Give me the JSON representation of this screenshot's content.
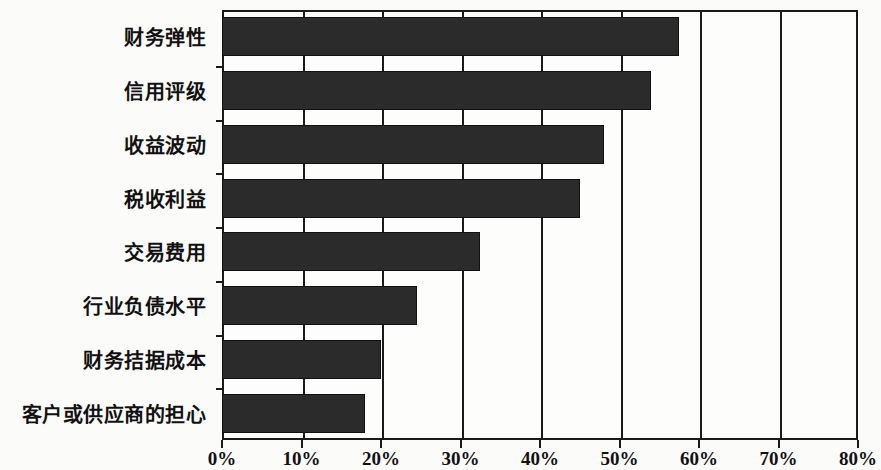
{
  "chart_data": {
    "type": "bar",
    "orientation": "horizontal",
    "title": "",
    "xlabel": "",
    "ylabel": "",
    "categories": [
      "财务弹性",
      "信用评级",
      "收益波动",
      "税收利益",
      "交易费用",
      "行业负债水平",
      "财务拮据成本",
      "客户或供应商的担心"
    ],
    "values": [
      57.5,
      54.0,
      48.0,
      45.0,
      32.5,
      24.5,
      20.0,
      18.0
    ],
    "value_format": "percent",
    "xlim": [
      0,
      80
    ],
    "xticks": [
      0,
      10,
      20,
      30,
      40,
      50,
      60,
      70,
      80
    ],
    "xtick_labels": [
      "0%",
      "10%",
      "20%",
      "30%",
      "40%",
      "50%",
      "60%",
      "70%",
      "80%"
    ],
    "grid": true,
    "grid_axis": "x",
    "legend": null,
    "series": [
      {
        "name": "",
        "values": [
          57.5,
          54.0,
          48.0,
          45.0,
          32.5,
          24.5,
          20.0,
          18.0
        ]
      }
    ],
    "colors": {
      "bar_fill": "#2b2b2b",
      "bar_stroke": "#111111",
      "axis": "#1a1a1a",
      "background": "#fbfbfa",
      "plot_background": "#fdfdfc",
      "text": "#111111"
    }
  }
}
